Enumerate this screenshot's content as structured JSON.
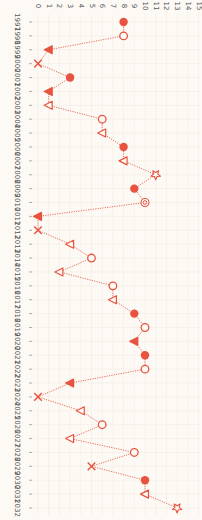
{
  "chart_data": {
    "type": "line",
    "orientation": "rotated-90-clockwise",
    "title": "",
    "xlabel": "",
    "ylabel": "",
    "ylim": [
      0,
      15
    ],
    "yticks": [
      0,
      1,
      2,
      3,
      4,
      5,
      6,
      7,
      8,
      9,
      10,
      11,
      12,
      13,
      14,
      15
    ],
    "grid": true,
    "legend": null,
    "color": "#e8533f",
    "background": "#fdfaf5",
    "x": [
      1997,
      1998,
      1999,
      2000,
      2001,
      2002,
      2003,
      2004,
      2005,
      2006,
      2007,
      2008,
      2009,
      2010,
      2011,
      2012,
      2013,
      2014,
      2015,
      2016,
      2017,
      2018,
      2019,
      2020,
      2021,
      2022,
      2023,
      2024,
      2025,
      2026,
      2027,
      2028,
      2029,
      2030,
      2031,
      2032
    ],
    "series": [
      {
        "name": "series",
        "values": [
          8,
          8,
          1,
          0,
          3,
          1,
          1,
          6,
          6,
          8,
          8,
          11,
          9,
          10,
          0,
          0,
          3,
          5,
          2,
          7,
          7,
          9,
          10,
          9,
          10,
          10,
          3,
          0,
          4,
          6,
          3,
          9,
          5,
          10,
          10,
          13
        ],
        "markers": [
          "circle-filled",
          "circle-open",
          "triangle-filled",
          "x",
          "circle-filled",
          "triangle-filled",
          "triangle-open",
          "circle-open",
          "triangle-open",
          "circle-filled",
          "triangle-open",
          "star",
          "circle-filled",
          "double-circle",
          "triangle-filled",
          "x",
          "triangle-open",
          "circle-open",
          "triangle-open",
          "circle-open",
          "triangle-open",
          "circle-filled",
          "circle-open",
          "triangle-filled",
          "circle-filled",
          "circle-open",
          "triangle-filled",
          "x",
          "triangle-open",
          "circle-open",
          "triangle-open",
          "circle-open",
          "x",
          "circle-filled",
          "triangle-open",
          "star"
        ]
      }
    ]
  }
}
